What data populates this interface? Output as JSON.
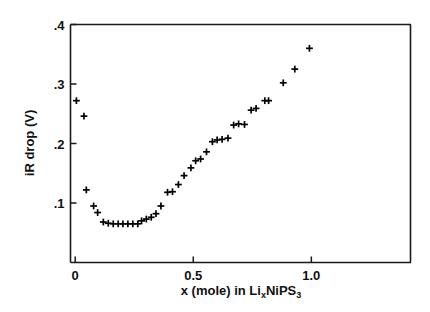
{
  "figure": {
    "background": "#ffffff",
    "ink_color": "#111111",
    "marker_symbol": "plus"
  },
  "axes": {
    "y_title_text": "iR drop (V)",
    "x_title_prefix": "x (mole) in  Li",
    "x_title_sub1": "x",
    "x_title_mid": "NiPS",
    "x_title_sub2": "3",
    "y_ticklabels": [
      ".1",
      ".2",
      ".3",
      ".4"
    ],
    "y_tickvalues": [
      0.1,
      0.2,
      0.3,
      0.4
    ],
    "x_ticklabels": [
      "0",
      "0.5",
      "1.0"
    ],
    "x_tickvalues": [
      0,
      0.5,
      1.0
    ]
  },
  "chart_data": {
    "type": "scatter",
    "title": "",
    "subtitle": "",
    "xlabel": "x (mole) in LixNiPS3",
    "ylabel": "iR drop (V)",
    "xlim": [
      -0.02,
      1.42
    ],
    "ylim": [
      0.0,
      0.4
    ],
    "grid": false,
    "legend": null,
    "marker": "+",
    "marker_color": "#000000",
    "series": [
      {
        "name": "iR drop",
        "points": [
          [
            0.005,
            0.272
          ],
          [
            0.037,
            0.246
          ],
          [
            0.047,
            0.122
          ],
          [
            0.078,
            0.095
          ],
          [
            0.095,
            0.084
          ],
          [
            0.119,
            0.068
          ],
          [
            0.14,
            0.066
          ],
          [
            0.161,
            0.065
          ],
          [
            0.182,
            0.065
          ],
          [
            0.202,
            0.065
          ],
          [
            0.223,
            0.065
          ],
          [
            0.244,
            0.065
          ],
          [
            0.265,
            0.065
          ],
          [
            0.281,
            0.07
          ],
          [
            0.301,
            0.073
          ],
          [
            0.322,
            0.076
          ],
          [
            0.342,
            0.082
          ],
          [
            0.363,
            0.095
          ],
          [
            0.391,
            0.118
          ],
          [
            0.412,
            0.119
          ],
          [
            0.437,
            0.131
          ],
          [
            0.461,
            0.146
          ],
          [
            0.49,
            0.159
          ],
          [
            0.51,
            0.171
          ],
          [
            0.531,
            0.174
          ],
          [
            0.556,
            0.186
          ],
          [
            0.581,
            0.203
          ],
          [
            0.601,
            0.206
          ],
          [
            0.622,
            0.207
          ],
          [
            0.647,
            0.209
          ],
          [
            0.671,
            0.231
          ],
          [
            0.692,
            0.233
          ],
          [
            0.717,
            0.232
          ],
          [
            0.745,
            0.256
          ],
          [
            0.766,
            0.259
          ],
          [
            0.803,
            0.272
          ],
          [
            0.819,
            0.272
          ],
          [
            0.881,
            0.302
          ],
          [
            0.93,
            0.325
          ],
          [
            0.992,
            0.36
          ]
        ]
      }
    ]
  }
}
